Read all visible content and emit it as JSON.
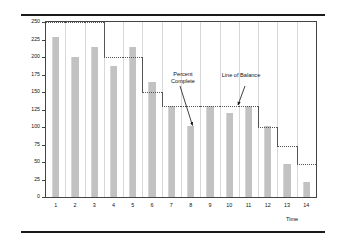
{
  "chart_data": {
    "type": "bar",
    "title": "",
    "xlabel": "Time",
    "ylabel": "Units of Production",
    "categories": [
      "1",
      "2",
      "3",
      "4",
      "5",
      "6",
      "7",
      "8",
      "9",
      "10",
      "11",
      "12",
      "13",
      "14"
    ],
    "values": [
      228,
      200,
      215,
      187,
      215,
      165,
      130,
      102,
      130,
      120,
      130,
      102,
      47,
      22
    ],
    "series": [
      {
        "name": "Percent Complete",
        "type": "bar",
        "values": [
          228,
          200,
          215,
          187,
          215,
          165,
          130,
          102,
          130,
          120,
          130,
          102,
          47,
          22
        ]
      },
      {
        "name": "Line of Balance",
        "type": "step",
        "values": [
          250,
          250,
          250,
          200,
          200,
          150,
          130,
          130,
          130,
          130,
          130,
          100,
          73,
          47
        ]
      }
    ],
    "ylim": [
      0,
      250
    ],
    "yticks": [
      0,
      25,
      50,
      75,
      100,
      125,
      150,
      175,
      200,
      225,
      250
    ],
    "ytick_labels": [
      "0",
      "25",
      "50",
      "75",
      "100",
      "125",
      "150",
      "175",
      "200",
      "225",
      "250"
    ],
    "xticks": [
      "1",
      "2",
      "3",
      "4",
      "5",
      "6",
      "7",
      "8",
      "9",
      "10",
      "11",
      "12",
      "13",
      "14"
    ],
    "grid": "vertical",
    "legend": "none",
    "bar_color": "#c2c2c2",
    "line_color": "#555555",
    "annotations": [
      {
        "id": "percent-complete",
        "text_line1": "Percent",
        "text_line2": "Complete",
        "points_to_category": "8",
        "points_to_value": 102
      },
      {
        "id": "line-of-balance",
        "text_line1": "Line of Balance",
        "text_line2": "",
        "points_to_category": "10",
        "points_to_value": 130
      }
    ]
  },
  "axes": {
    "y_title": "Units of Production",
    "x_title": "Time",
    "y_tick_labels": [
      "250",
      "225",
      "200",
      "175",
      "150",
      "125",
      "100",
      "75",
      "50",
      "25",
      "0"
    ],
    "x_tick_labels": [
      "1",
      "2",
      "3",
      "4",
      "5",
      "6",
      "7",
      "8",
      "9",
      "10",
      "11",
      "12",
      "13",
      "14"
    ]
  },
  "annotations": {
    "percent_complete_l1": "Percent",
    "percent_complete_l2": "Complete",
    "line_of_balance": "Line of Balance"
  }
}
